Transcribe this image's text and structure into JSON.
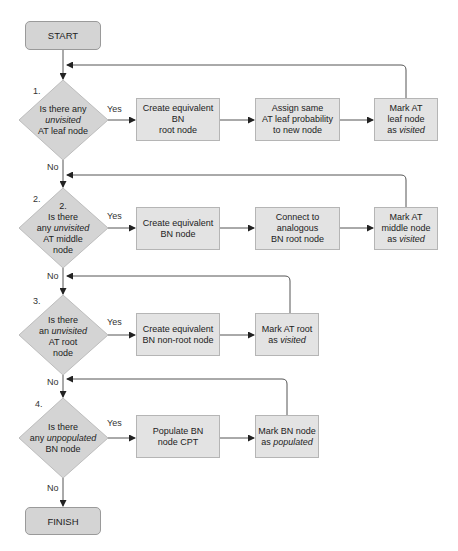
{
  "flowchart": {
    "start": "START",
    "finish": "FINISH",
    "yes_label": "Yes",
    "no_label": "No",
    "steps": [
      {
        "number": "1.",
        "decision": [
          "Is there any",
          "unvisited",
          "AT leaf node"
        ],
        "actions": [
          [
            "Create equivalent BN",
            "root node"
          ],
          [
            "Assign same",
            "AT leaf probability",
            "to new node"
          ],
          [
            "Mark AT",
            "leaf node",
            "as",
            "visited"
          ]
        ]
      },
      {
        "number": "2.",
        "inner_number": "2.",
        "decision": [
          "Is there",
          "any",
          "unvisited",
          "AT middle",
          "node"
        ],
        "actions": [
          [
            "Create equivalent",
            "BN node"
          ],
          [
            "Connect to",
            "analogous",
            "BN root node"
          ],
          [
            "Mark AT",
            "middle node",
            "as",
            "visited"
          ]
        ]
      },
      {
        "number": "3.",
        "decision": [
          "Is there",
          "an",
          "unvisited",
          "AT root",
          "node"
        ],
        "actions": [
          [
            "Create equivalent",
            "BN non-root node"
          ],
          [
            "Mark AT root",
            "as",
            "visited"
          ]
        ]
      },
      {
        "number": "4.",
        "decision": [
          "Is there",
          "any",
          "unpopulated",
          "BN node"
        ],
        "actions": [
          [
            "Populate BN",
            "node CPT"
          ],
          [
            "Mark BN node",
            "as",
            "populated"
          ]
        ]
      }
    ]
  }
}
